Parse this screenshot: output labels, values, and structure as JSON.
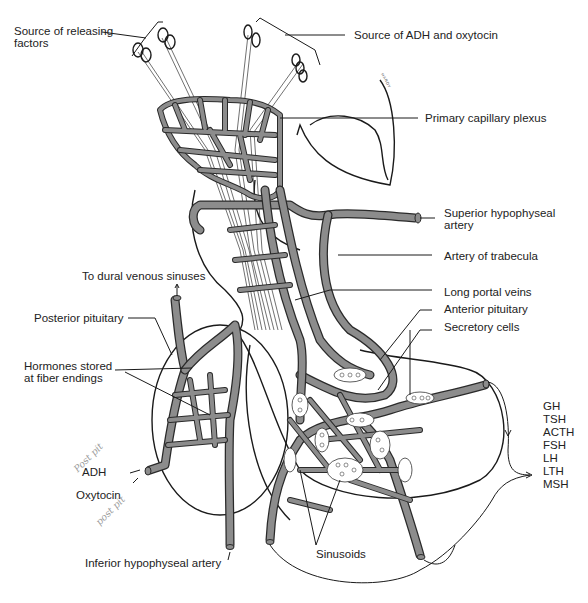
{
  "figure": {
    "colors": {
      "vessel_fill": "#8c8c8c",
      "vessel_outline": "#2a2a2a",
      "background": "#ffffff",
      "line": "#1a1a1a",
      "handwriting": "#9a9a9a"
    }
  },
  "labels": {
    "source_releasing_factors": "Source of releasing factors",
    "source_adh_oxytocin": "Source of ADH and oxytocin",
    "primary_capillary_plexus": "Primary capillary plexus",
    "superior_hypophyseal_artery": "Superior hypophyseal artery",
    "artery_of_trabecula": "Artery of trabecula",
    "to_dural_venous_sinuses": "To dural venous sinuses",
    "long_portal_veins": "Long portal veins",
    "anterior_pituitary": "Anterior pituitary",
    "secretory_cells": "Secretory cells",
    "posterior_pituitary": "Posterior pituitary",
    "hormones_stored": "Hormones stored at fiber endings",
    "adh": "ADH",
    "oxytocin": "Oxytocin",
    "inferior_hypophyseal_artery": "Inferior hypophyseal artery",
    "sinusoids": "Sinusoids"
  },
  "anterior_hormones": [
    "GH",
    "TSH",
    "ACTH",
    "FSH",
    "LH",
    "LTH",
    "MSH"
  ],
  "handwritten_notes": {
    "near_adh": "Post pit",
    "near_oxytocin": "post pit"
  },
  "signature": "HARDY"
}
